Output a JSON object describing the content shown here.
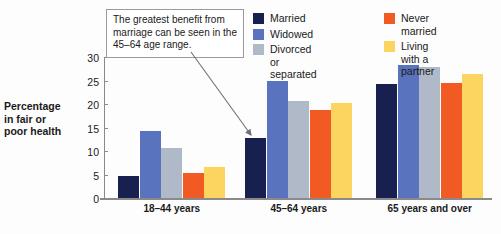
{
  "chart_data": {
    "type": "bar",
    "title": "",
    "xlabel": "",
    "ylabel": "Percentage in fair or poor health",
    "ylim": [
      0,
      30
    ],
    "yticks": [
      0,
      5,
      10,
      15,
      20,
      25,
      30
    ],
    "grid": false,
    "legend_position": "top-right",
    "categories": [
      "18–44 years",
      "45–64 years",
      "65 years and over"
    ],
    "series": [
      {
        "name": "Married",
        "color": "#18204f",
        "values": [
          4.6,
          12.8,
          24.2
        ]
      },
      {
        "name": "Widowed",
        "color": "#5a73bf",
        "values": [
          14.2,
          24.9,
          28.2
        ]
      },
      {
        "name": "Divorced or separated",
        "color": "#b0b9c8",
        "values": [
          10.6,
          20.6,
          27.9
        ]
      },
      {
        "name": "Never married",
        "color": "#f15a22",
        "values": [
          5.3,
          18.8,
          24.4
        ]
      },
      {
        "name": "Living with a partner",
        "color": "#fbd55f",
        "values": [
          6.7,
          20.2,
          26.4
        ]
      }
    ],
    "annotations": [
      {
        "text": "The greatest benefit from marriage can be seen in the 45–64 age range.",
        "points_to": "Married bar, 45–64 years"
      }
    ]
  },
  "axis": {
    "y_title_line1": "Percentage",
    "y_title_line2": "in fair or",
    "y_title_line3": "poor health",
    "ticks": [
      "30",
      "25",
      "20",
      "15",
      "10",
      "5",
      "0"
    ]
  },
  "legend": {
    "column1": [
      {
        "label": "Married",
        "color": "#18204f"
      },
      {
        "label": "Widowed",
        "color": "#5a73bf"
      },
      {
        "label": "Divorced or separated",
        "color": "#b0b9c8"
      }
    ],
    "column2": [
      {
        "label": "Never married",
        "color": "#f15a22"
      },
      {
        "label": "Living with a partner",
        "color": "#fbd55f"
      }
    ]
  },
  "callout": {
    "text": "The greatest benefit from marriage can be seen in the 45–64 age range."
  },
  "xlabels": [
    "18–44 years",
    "45–64 years",
    "65 years and over"
  ]
}
